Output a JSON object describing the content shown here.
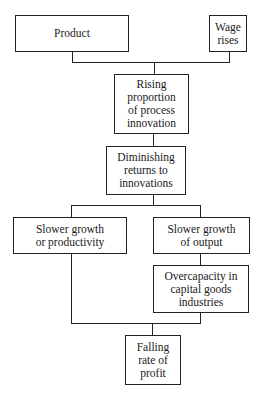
{
  "diagram": {
    "type": "flowchart",
    "nodes": [
      {
        "id": "product",
        "label": "Product"
      },
      {
        "id": "wage",
        "label": "Wage\nrises"
      },
      {
        "id": "rising",
        "label": "Rising\nproportion\nof process\ninnovation"
      },
      {
        "id": "diminishing",
        "label": "Diminishing\nreturns to\ninnovations"
      },
      {
        "id": "slower_prod",
        "label": "Slower growth\nor productivity"
      },
      {
        "id": "slower_output",
        "label": "Slower growth\nof output"
      },
      {
        "id": "overcapacity",
        "label": "Overcapacity in\ncapital goods\nindustries"
      },
      {
        "id": "falling",
        "label": "Falling\nrate of\nprofit"
      }
    ],
    "edges": [
      {
        "from": "product",
        "to": "rising"
      },
      {
        "from": "wage",
        "to": "rising"
      },
      {
        "from": "rising",
        "to": "diminishing"
      },
      {
        "from": "diminishing",
        "to": "slower_prod"
      },
      {
        "from": "diminishing",
        "to": "slower_output"
      },
      {
        "from": "slower_output",
        "to": "overcapacity"
      },
      {
        "from": "slower_prod",
        "to": "falling"
      },
      {
        "from": "overcapacity",
        "to": "falling"
      }
    ]
  }
}
